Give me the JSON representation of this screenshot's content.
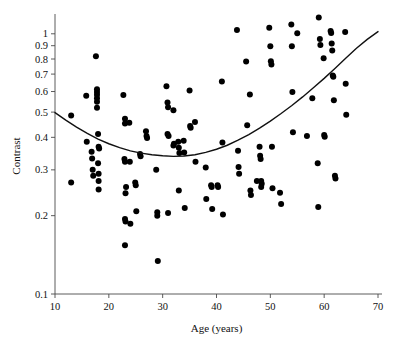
{
  "chart_data": {
    "type": "scatter",
    "title": "",
    "xlabel": "Age (years)",
    "ylabel": "Contrast",
    "xlim": [
      10,
      70
    ],
    "ylim": [
      0.1,
      1.15
    ],
    "yscale": "log",
    "xscale": "linear",
    "grid": false,
    "legend": null,
    "xticks": [
      10,
      20,
      30,
      40,
      50,
      60,
      70
    ],
    "xtick_labels": [
      "10",
      "20",
      "30",
      "40",
      "50",
      "60",
      "70"
    ],
    "yticks": [
      0.1,
      0.2,
      0.3,
      0.4,
      0.5,
      0.6,
      0.7,
      0.8,
      0.9,
      1
    ],
    "ytick_labels": [
      "0.1",
      "0.2",
      "0.3",
      "0.4",
      "0.5",
      "0.6",
      "0.7",
      "0.8",
      "0.9",
      "1"
    ],
    "marker": "filled-circle",
    "marker_color": "#000000",
    "marker_size": 3.0,
    "points": [
      [
        13.0,
        0.485
      ],
      [
        13.0,
        0.268
      ],
      [
        15.8,
        0.578
      ],
      [
        15.9,
        0.385
      ],
      [
        16.8,
        0.352
      ],
      [
        16.9,
        0.332
      ],
      [
        17.0,
        0.3
      ],
      [
        17.1,
        0.285
      ],
      [
        17.6,
        0.82
      ],
      [
        17.8,
        0.612
      ],
      [
        17.8,
        0.598
      ],
      [
        17.8,
        0.583
      ],
      [
        17.8,
        0.565
      ],
      [
        17.8,
        0.548
      ],
      [
        17.8,
        0.52
      ],
      [
        18.0,
        0.412
      ],
      [
        18.1,
        0.368
      ],
      [
        18.2,
        0.362
      ],
      [
        18.0,
        0.318
      ],
      [
        18.1,
        0.29
      ],
      [
        18.1,
        0.272
      ],
      [
        18.1,
        0.252
      ],
      [
        22.7,
        0.582
      ],
      [
        23.0,
        0.472
      ],
      [
        23.0,
        0.452
      ],
      [
        22.9,
        0.33
      ],
      [
        23.0,
        0.322
      ],
      [
        23.2,
        0.258
      ],
      [
        23.1,
        0.244
      ],
      [
        23.0,
        0.194
      ],
      [
        23.1,
        0.19
      ],
      [
        23.0,
        0.154
      ],
      [
        23.8,
        0.455
      ],
      [
        23.9,
        0.322
      ],
      [
        24.0,
        0.186
      ],
      [
        24.9,
        0.268
      ],
      [
        25.0,
        0.262
      ],
      [
        25.1,
        0.208
      ],
      [
        25.8,
        0.345
      ],
      [
        25.9,
        0.338
      ],
      [
        26.9,
        0.422
      ],
      [
        27.0,
        0.405
      ],
      [
        27.1,
        0.398
      ],
      [
        28.8,
        0.3
      ],
      [
        29.0,
        0.206
      ],
      [
        29.0,
        0.2
      ],
      [
        29.1,
        0.134
      ],
      [
        30.7,
        0.628
      ],
      [
        30.9,
        0.545
      ],
      [
        31.0,
        0.522
      ],
      [
        30.9,
        0.412
      ],
      [
        31.1,
        0.405
      ],
      [
        31.0,
        0.205
      ],
      [
        32.0,
        0.508
      ],
      [
        32.1,
        0.378
      ],
      [
        32.0,
        0.372
      ],
      [
        32.9,
        0.385
      ],
      [
        33.0,
        0.365
      ],
      [
        33.1,
        0.348
      ],
      [
        33.0,
        0.25
      ],
      [
        33.9,
        0.388
      ],
      [
        34.0,
        0.35
      ],
      [
        34.1,
        0.214
      ],
      [
        35.0,
        0.605
      ],
      [
        35.1,
        0.442
      ],
      [
        35.2,
        0.435
      ],
      [
        36.0,
        0.458
      ],
      [
        36.1,
        0.322
      ],
      [
        38.0,
        0.306
      ],
      [
        38.1,
        0.232
      ],
      [
        39.0,
        0.262
      ],
      [
        39.1,
        0.258
      ],
      [
        39.2,
        0.212
      ],
      [
        40.2,
        0.262
      ],
      [
        40.3,
        0.258
      ],
      [
        41.0,
        0.655
      ],
      [
        41.1,
        0.382
      ],
      [
        41.2,
        0.202
      ],
      [
        43.8,
        1.035
      ],
      [
        44.0,
        0.355
      ],
      [
        44.1,
        0.308
      ],
      [
        44.2,
        0.29
      ],
      [
        45.5,
        0.782
      ],
      [
        45.7,
        0.445
      ],
      [
        46.2,
        0.585
      ],
      [
        46.3,
        0.25
      ],
      [
        46.4,
        0.24
      ],
      [
        47.5,
        0.272
      ],
      [
        48.0,
        0.368
      ],
      [
        48.1,
        0.34
      ],
      [
        48.2,
        0.33
      ],
      [
        48.3,
        0.272
      ],
      [
        48.4,
        0.265
      ],
      [
        48.3,
        0.258
      ],
      [
        49.8,
        1.055
      ],
      [
        50.0,
        0.895
      ],
      [
        50.1,
        0.785
      ],
      [
        50.2,
        0.762
      ],
      [
        50.3,
        0.368
      ],
      [
        50.4,
        0.255
      ],
      [
        51.8,
        0.245
      ],
      [
        52.0,
        0.222
      ],
      [
        53.9,
        1.085
      ],
      [
        54.0,
        0.895
      ],
      [
        54.1,
        0.598
      ],
      [
        54.2,
        0.418
      ],
      [
        55.0,
        1.005
      ],
      [
        56.8,
        0.405
      ],
      [
        57.8,
        0.565
      ],
      [
        58.8,
        0.318
      ],
      [
        58.9,
        0.216
      ],
      [
        59.0,
        1.155
      ],
      [
        59.2,
        0.955
      ],
      [
        59.3,
        0.905
      ],
      [
        59.9,
        0.805
      ],
      [
        60.0,
        0.408
      ],
      [
        60.1,
        0.402
      ],
      [
        61.2,
        1.025
      ],
      [
        61.3,
        1.008
      ],
      [
        61.4,
        0.918
      ],
      [
        61.5,
        0.862
      ],
      [
        61.6,
        0.692
      ],
      [
        61.7,
        0.684
      ],
      [
        61.8,
        0.555
      ],
      [
        62.0,
        0.285
      ],
      [
        62.1,
        0.278
      ],
      [
        63.9,
        1.015
      ],
      [
        64.0,
        0.642
      ],
      [
        64.1,
        0.488
      ]
    ],
    "fit_curve": {
      "label": "quadratic fit",
      "color": "#111111",
      "x": [
        10,
        12,
        14,
        16,
        18,
        20,
        22,
        24,
        26,
        28,
        30,
        32,
        34,
        36,
        38,
        40,
        42,
        44,
        46,
        48,
        50,
        52,
        54,
        56,
        58,
        60,
        62,
        64,
        66,
        68,
        70
      ],
      "y": [
        0.498,
        0.466,
        0.438,
        0.414,
        0.394,
        0.378,
        0.365,
        0.355,
        0.348,
        0.343,
        0.34,
        0.338,
        0.339,
        0.343,
        0.35,
        0.36,
        0.373,
        0.39,
        0.41,
        0.434,
        0.462,
        0.494,
        0.53,
        0.572,
        0.62,
        0.674,
        0.736,
        0.805,
        0.88,
        0.952,
        1.02
      ]
    }
  }
}
